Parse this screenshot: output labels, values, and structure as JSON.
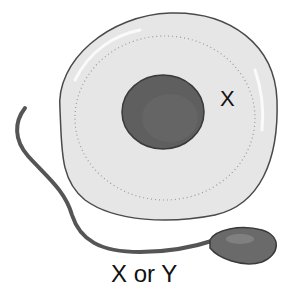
{
  "diagram": {
    "egg_cell": {
      "label": "X",
      "colors": {
        "fill": "#e6e6e6",
        "outline": "#4a4a4a",
        "nucleus": "#5f5f5f",
        "speckle": "#9a9a9a"
      }
    },
    "sperm_cell": {
      "label": "X or Y",
      "colors": {
        "tail": "#555555",
        "head": "#6a6a6a",
        "outline": "#3a3a3a"
      }
    }
  }
}
